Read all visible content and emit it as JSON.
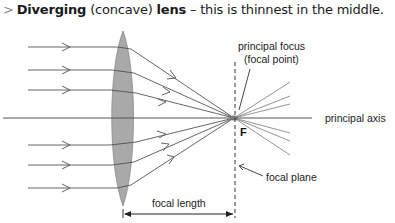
{
  "heading": {
    "marker": ">",
    "term_bold": "Diverging",
    "term_paren": "(concave)",
    "term_bold2": "lens",
    "rest": "– this is thinnest in the middle."
  },
  "diagram": {
    "labels": {
      "principal_focus_line1": "principal focus",
      "principal_focus_line2": "(focal point)",
      "principal_axis": "principal axis",
      "focus_letter": "F",
      "focal_plane": "focal plane",
      "focal_length": "focal length"
    },
    "colors": {
      "lens_fill": "#a9a9a9",
      "lens_stroke": "#8c8c8c",
      "ray": "#555555",
      "ray_after_focus": "#888888",
      "text": "#222222"
    },
    "incident_ray_heights_px": [
      47,
      70,
      90,
      145,
      165,
      188
    ],
    "axis_y_px": 118,
    "focal_point_px": [
      234,
      118
    ]
  }
}
